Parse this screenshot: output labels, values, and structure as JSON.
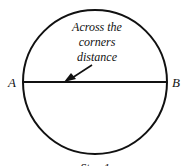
{
  "diagram": {
    "annotation": [
      "Across the",
      "corners",
      "distance"
    ],
    "point_left": "A",
    "point_right": "B",
    "caption": "Step 1",
    "colors": {
      "stroke": "#111111",
      "background": "#ffffff"
    }
  }
}
